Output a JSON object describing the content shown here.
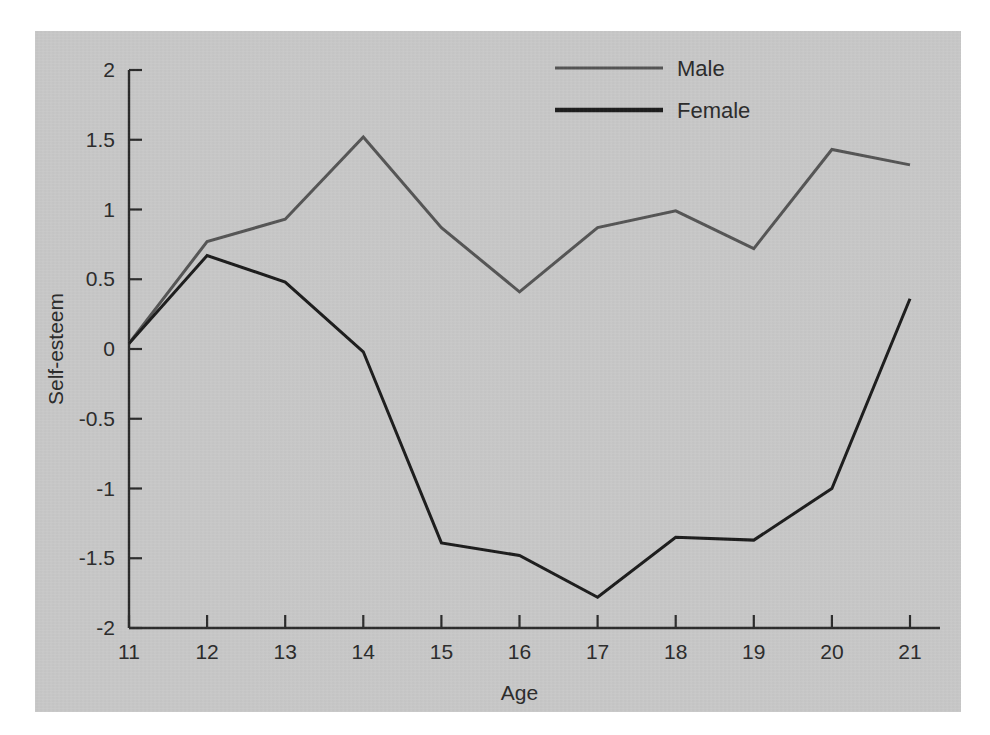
{
  "figure": {
    "background_color": "#c9c9c9",
    "page_color": "#ffffff",
    "axis_color": "#2b2b2b"
  },
  "legend": {
    "position": "top-center-right",
    "entries": [
      {
        "label": "Male",
        "color": "#555555",
        "line_width": 3
      },
      {
        "label": "Female",
        "color": "#1c1c1c",
        "line_width": 4.5
      }
    ]
  },
  "axes": {
    "x_title": "Age",
    "y_title": "Self-esteem",
    "x_tick_labels": [
      "11",
      "12",
      "13",
      "14",
      "15",
      "16",
      "17",
      "18",
      "19",
      "20",
      "21"
    ],
    "y_tick_labels": [
      "2",
      "1.5",
      "1",
      "0.5",
      "0",
      "-0.5",
      "-1",
      "-1.5",
      "-2"
    ]
  },
  "chart_data": {
    "type": "line",
    "title": "",
    "xlabel": "Age",
    "ylabel": "Self-esteem",
    "x": [
      11,
      12,
      13,
      14,
      15,
      16,
      17,
      18,
      19,
      20,
      21
    ],
    "xlim": [
      11,
      21
    ],
    "ylim": [
      -2,
      2
    ],
    "y_ticks": [
      2,
      1.5,
      1,
      0.5,
      0,
      -0.5,
      -1,
      -1.5,
      -2
    ],
    "grid": false,
    "legend_position": "upper center",
    "series": [
      {
        "name": "Male",
        "color": "#555555",
        "values": [
          0.04,
          0.77,
          0.93,
          1.52,
          0.87,
          0.41,
          0.87,
          0.99,
          0.72,
          1.43,
          1.32
        ]
      },
      {
        "name": "Female",
        "color": "#1c1c1c",
        "values": [
          0.04,
          0.67,
          0.48,
          -0.02,
          -1.39,
          -1.48,
          -1.78,
          -1.35,
          -1.37,
          -1.0,
          0.36
        ]
      }
    ]
  }
}
